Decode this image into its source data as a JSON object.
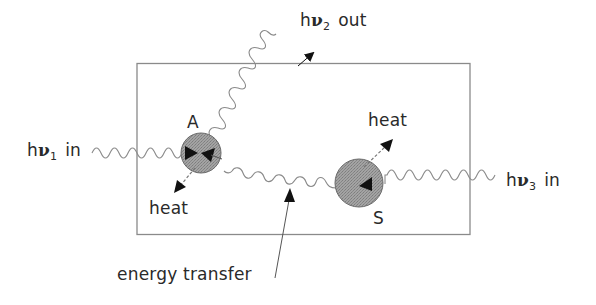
{
  "diagram": {
    "box": {
      "x": 137,
      "y": 63,
      "width": 333,
      "height": 171,
      "stroke": "#777777"
    },
    "molecules": {
      "A": {
        "label": "A",
        "cx": 201,
        "cy": 153,
        "r": 20,
        "fill": "#9a9a9a"
      },
      "S": {
        "label": "S",
        "cx": 359,
        "cy": 183,
        "r": 24,
        "fill": "#9a9a9a"
      }
    },
    "labels": {
      "photon_in_1": {
        "h": "h",
        "nu": "ν",
        "sub": "1",
        "word": "in"
      },
      "photon_out_2": {
        "h": "h",
        "nu": "ν",
        "sub": "2",
        "word": "out"
      },
      "photon_in_3": {
        "h": "h",
        "nu": "ν",
        "sub": "3",
        "word": "in"
      },
      "heat_A": "heat",
      "heat_S": "heat",
      "energy_transfer": "energy transfer"
    },
    "colors": {
      "wave": "#8a8a8a",
      "arrowhead": "#111111",
      "text": "#2a2a2a",
      "molecule_fill": "#9a9a9a",
      "molecule_stroke": "#6a6a6a"
    }
  }
}
